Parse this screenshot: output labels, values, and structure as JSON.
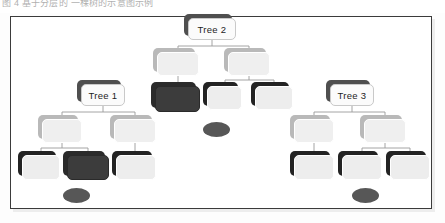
{
  "caption": {
    "text": "图 4  基于分层的 一棵树的示意图示例"
  },
  "figure": {
    "background_color": "#ffffff",
    "frame_border_color": "#3b3b3b",
    "link_color": "#9a9a9a",
    "colors": {
      "node_light_fill": "#efefef",
      "node_light_shadow": "#b9b9b9",
      "node_dark_fill": "#3c3c3c",
      "node_dark_shadow": "#2b2b2b",
      "label_fill": "#fbfbfb",
      "label_shadow": "#4f4f4f",
      "ellipse_fill": "#575757"
    },
    "labels": {
      "tree1": "Tree 1",
      "tree2": "Tree 2",
      "tree3": "Tree 3"
    },
    "nodes": [
      {
        "id": "t2",
        "label": "Tree 2",
        "style": "label",
        "x": 188,
        "y": 18,
        "w": 48,
        "h": 22
      },
      {
        "id": "n-l1",
        "label": "",
        "style": "light",
        "x": 157,
        "y": 52,
        "w": 42,
        "h": 24
      },
      {
        "id": "n-r1",
        "label": "",
        "style": "light",
        "x": 228,
        "y": 52,
        "w": 42,
        "h": 24
      },
      {
        "id": "t1",
        "label": "Tree 1",
        "style": "label",
        "x": 81,
        "y": 84,
        "w": 44,
        "h": 22
      },
      {
        "id": "n-c2",
        "label": "",
        "style": "dark",
        "x": 155,
        "y": 86,
        "w": 45,
        "h": 26
      },
      {
        "id": "n-c3",
        "label": "",
        "style": "darkshadow",
        "x": 207,
        "y": 86,
        "w": 35,
        "h": 24
      },
      {
        "id": "n-c4",
        "label": "",
        "style": "darkshadow",
        "x": 255,
        "y": 86,
        "w": 38,
        "h": 24
      },
      {
        "id": "t3",
        "label": "Tree 3",
        "style": "label",
        "x": 330,
        "y": 84,
        "w": 44,
        "h": 22
      },
      {
        "id": "n-l2",
        "label": "",
        "style": "light",
        "x": 42,
        "y": 119,
        "w": 40,
        "h": 24
      },
      {
        "id": "n-l3",
        "label": "",
        "style": "light",
        "x": 114,
        "y": 119,
        "w": 42,
        "h": 24
      },
      {
        "id": "n-r2",
        "label": "",
        "style": "light",
        "x": 294,
        "y": 119,
        "w": 40,
        "h": 24
      },
      {
        "id": "n-r3",
        "label": "",
        "style": "light",
        "x": 364,
        "y": 119,
        "w": 42,
        "h": 24
      },
      {
        "id": "n-b1",
        "label": "",
        "style": "darkshadow",
        "x": 22,
        "y": 155,
        "w": 38,
        "h": 25
      },
      {
        "id": "n-b2",
        "label": "",
        "style": "dark",
        "x": 67,
        "y": 155,
        "w": 42,
        "h": 25
      },
      {
        "id": "n-b3",
        "label": "",
        "style": "darkshadow",
        "x": 116,
        "y": 155,
        "w": 40,
        "h": 25
      },
      {
        "id": "n-b4",
        "label": "",
        "style": "darkshadow",
        "x": 294,
        "y": 155,
        "w": 40,
        "h": 25
      },
      {
        "id": "n-b5",
        "label": "",
        "style": "darkshadow",
        "x": 342,
        "y": 155,
        "w": 40,
        "h": 25
      },
      {
        "id": "n-b6",
        "label": "",
        "style": "darkshadow",
        "x": 390,
        "y": 155,
        "w": 40,
        "h": 25
      }
    ],
    "ellipses": [
      {
        "id": "e-center",
        "x": 203,
        "y": 122,
        "w": 27,
        "h": 15
      },
      {
        "id": "e-left",
        "x": 63,
        "y": 188,
        "w": 27,
        "h": 15
      },
      {
        "id": "e-right",
        "x": 352,
        "y": 188,
        "w": 27,
        "h": 15
      }
    ],
    "links": [
      {
        "x1": 212,
        "y1": 40,
        "x2": 212,
        "y2": 46
      },
      {
        "x1": 178,
        "y1": 46,
        "x2": 249,
        "y2": 46
      },
      {
        "x1": 178,
        "y1": 46,
        "x2": 178,
        "y2": 52
      },
      {
        "x1": 249,
        "y1": 46,
        "x2": 249,
        "y2": 52
      },
      {
        "x1": 178,
        "y1": 76,
        "x2": 178,
        "y2": 86
      },
      {
        "x1": 249,
        "y1": 76,
        "x2": 249,
        "y2": 80
      },
      {
        "x1": 225,
        "y1": 80,
        "x2": 274,
        "y2": 80
      },
      {
        "x1": 225,
        "y1": 80,
        "x2": 225,
        "y2": 86
      },
      {
        "x1": 274,
        "y1": 80,
        "x2": 274,
        "y2": 86
      },
      {
        "x1": 103,
        "y1": 106,
        "x2": 103,
        "y2": 112
      },
      {
        "x1": 62,
        "y1": 112,
        "x2": 135,
        "y2": 112
      },
      {
        "x1": 62,
        "y1": 112,
        "x2": 62,
        "y2": 119
      },
      {
        "x1": 135,
        "y1": 112,
        "x2": 135,
        "y2": 119
      },
      {
        "x1": 352,
        "y1": 106,
        "x2": 352,
        "y2": 112
      },
      {
        "x1": 314,
        "y1": 112,
        "x2": 385,
        "y2": 112
      },
      {
        "x1": 314,
        "y1": 112,
        "x2": 314,
        "y2": 119
      },
      {
        "x1": 385,
        "y1": 112,
        "x2": 385,
        "y2": 119
      },
      {
        "x1": 62,
        "y1": 143,
        "x2": 62,
        "y2": 148
      },
      {
        "x1": 41,
        "y1": 148,
        "x2": 88,
        "y2": 148
      },
      {
        "x1": 41,
        "y1": 148,
        "x2": 41,
        "y2": 155
      },
      {
        "x1": 88,
        "y1": 148,
        "x2": 88,
        "y2": 155
      },
      {
        "x1": 135,
        "y1": 143,
        "x2": 135,
        "y2": 155
      },
      {
        "x1": 314,
        "y1": 143,
        "x2": 314,
        "y2": 155
      },
      {
        "x1": 385,
        "y1": 143,
        "x2": 385,
        "y2": 148
      },
      {
        "x1": 362,
        "y1": 148,
        "x2": 410,
        "y2": 148
      },
      {
        "x1": 362,
        "y1": 148,
        "x2": 362,
        "y2": 155
      },
      {
        "x1": 410,
        "y1": 148,
        "x2": 410,
        "y2": 155
      }
    ]
  }
}
